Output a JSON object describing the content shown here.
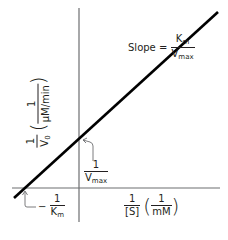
{
  "diagram": {
    "type": "Lineweaver-Burk double-reciprocal plot",
    "slope_label": {
      "prefix": "Slope =",
      "numerator": "K",
      "numerator_sub": "m",
      "denominator": "V",
      "denominator_sub": "max"
    },
    "y_axis_label": {
      "numerator": "1",
      "denominator": "V",
      "denominator_sub": "0",
      "unit_numerator": "1",
      "unit_denominator": "µM/min"
    },
    "x_axis_label": {
      "numerator": "1",
      "denominator": "[S]",
      "unit_numerator": "1",
      "unit_denominator": "mM"
    },
    "y_intercept_label": {
      "numerator": "1",
      "denominator": "V",
      "denominator_sub": "max"
    },
    "x_intercept_label": {
      "sign": "−",
      "numerator": "1",
      "denominator": "K",
      "denominator_sub": "m"
    },
    "colors": {
      "line": "#000000",
      "axis": "#6d6e71",
      "text": "#231f20"
    }
  }
}
